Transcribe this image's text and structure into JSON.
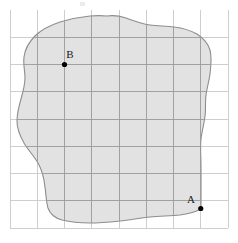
{
  "figure": {
    "background_color": "#ffffff",
    "canvas": {
      "width": 238,
      "height": 243
    }
  },
  "grid": {
    "name": "square-grid",
    "columns": 8,
    "rows": 8,
    "x_start": 10,
    "y_start": 10,
    "cell_size": 27.25,
    "line_color": "#9a9a9a",
    "line_color_light": "#c9c9c9",
    "x_positions": [
      10,
      37.25,
      64.5,
      91.75,
      119,
      146.25,
      173.5,
      200.75,
      228
    ],
    "y_positions": [
      10,
      37.25,
      64.5,
      91.75,
      119,
      146.25,
      173.5,
      200.75,
      228
    ]
  },
  "region": {
    "name": "shaded-region",
    "fill_color": "#e2e2e2",
    "stroke_color": "#8d8d8d",
    "path": "M 107 16 C 114 15 120 16 126 18 C 134 21 142 24 150 25 C 158 26 166 26 174 27 C 182 28 190 30 197 34 C 203 38 208 43 210 50 C 212 58 211 66 210 74 C 209 81 207 88 206 95 C 205 102 206 109 205 116 C 204 124 202 131 201 139 C 200 148 201 157 201 166 C 201 176 201 186 201 196 C 201 202 201 206 201 209 C 195 212 188 214 180 215 C 170 216 160 216 150 217 C 140 218 130 220 120 221 C 110 222 100 223 90 223 C 80 223 70 222 62 220 C 55 218 50 214 48 208 C 46 201 46 194 45 187 C 44 178 42 170 38 163 C 34 156 28 150 24 143 C 20 136 17 129 17 121 C 17 113 19 106 21 99 C 23 92 25 85 25 78 C 25 71 23 64 24 57 C 25 49 29 42 35 36 C 42 29 51 25 60 22 C 70 19 80 17 90 16 C 96 15.5 101.5 15.5 107 16 Z"
  },
  "points": [
    {
      "id": "point-b",
      "label": "B",
      "x": 64.5,
      "y": 64.5,
      "label_x": 70,
      "label_y": 58,
      "color": "#000000",
      "radius": 2.6,
      "position": "interior"
    },
    {
      "id": "point-a",
      "label": "A",
      "x": 200.75,
      "y": 208.5,
      "label_x": 191,
      "label_y": 203,
      "color": "#000000",
      "radius": 2.6,
      "position": "boundary"
    }
  ],
  "artifact": {
    "name": "top-edge-mark",
    "x": 80,
    "y": 2,
    "width": 5,
    "height": 4,
    "color": "#c8c8c8"
  }
}
